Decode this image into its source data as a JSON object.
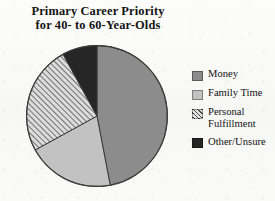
{
  "chart_data": {
    "type": "pie",
    "title": "Primary Career Priority for 40- to 60-Year-Olds",
    "title_lines": [
      "Primary Career Priority",
      "for 40- to 60-Year-Olds"
    ],
    "categories": [
      "Money",
      "Family Time",
      "Personal Fulfillment",
      "Other/Unsure"
    ],
    "values": [
      47,
      20,
      25,
      8
    ],
    "value_unit": "percent",
    "legend_position": "right",
    "grid": false,
    "xlabel": "",
    "ylabel": "",
    "start_angle_deg": 0,
    "direction": "clockwise",
    "slices": [
      {
        "label": "Money",
        "value": 47,
        "color": "#8c8c8c",
        "fill_style": "solid",
        "start_deg": 0,
        "end_deg": 169.2
      },
      {
        "label": "Family Time",
        "value": 20,
        "color": "#c2c2c2",
        "fill_style": "solid",
        "start_deg": 169.2,
        "end_deg": 241.2
      },
      {
        "label": "Personal Fulfillment",
        "value": 25,
        "color": "#d9d9d9",
        "fill_style": "diagonal-hatch",
        "hatch_color": "#4a4a4a",
        "start_deg": 241.2,
        "end_deg": 331.2
      },
      {
        "label": "Other/Unsure",
        "value": 8,
        "color": "#262626",
        "fill_style": "solid",
        "start_deg": 331.2,
        "end_deg": 360
      }
    ]
  },
  "legend": {
    "items": [
      {
        "label": "Money",
        "swatch": "money-swatch"
      },
      {
        "label": "Family Time",
        "swatch": "family-time-swatch"
      },
      {
        "label": "Personal Fulfillment",
        "swatch": "personal-fulfillment-swatch"
      },
      {
        "label": "Other/Unsure",
        "swatch": "other-unsure-swatch"
      }
    ]
  },
  "colors": {
    "money": "#8c8c8c",
    "family_time": "#c2c2c2",
    "personal_fulfillment_hatch": "#4a4a4a",
    "personal_fulfillment_base": "#d9d9d9",
    "other_unsure": "#262626",
    "outline": "#3a3a3a",
    "background": "#fbfbfa",
    "text": "#121212"
  }
}
